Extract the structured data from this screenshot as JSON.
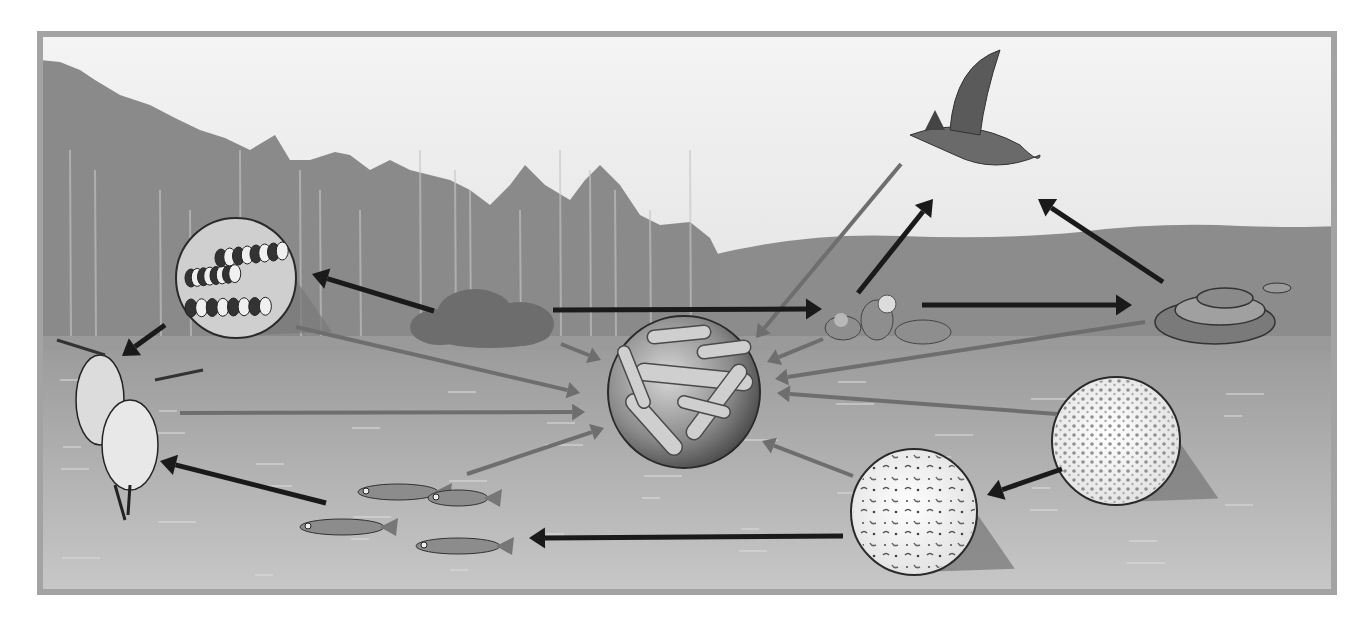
{
  "diagram": {
    "type": "food-web",
    "frame": {
      "x": 40,
      "y": 34,
      "w": 1294,
      "h": 558,
      "border_color": "#a3a3a3",
      "border_width": 6
    },
    "colors": {
      "sky_top": "#f4f4f4",
      "sky_bottom": "#e2e2e2",
      "forest": "#8a8a8a",
      "forest_dark": "#6f6f6f",
      "hill": "#8c8c8c",
      "shore": "#9a9a9a",
      "water_top": "#9c9c9c",
      "water_bottom": "#c9c9c9",
      "feeding_arrow": "#1a1a1a",
      "decomposer_arrow": "#6e6e6e",
      "circle_edge": "#2a2a2a",
      "callout_shadow": "#7a7a7a"
    },
    "nodes": [
      {
        "id": "hawk",
        "label": "hawk",
        "role": "tertiary-consumer",
        "x": 975,
        "y": 125
      },
      {
        "id": "snake",
        "label": "snake",
        "role": "secondary-consumer",
        "x": 1215,
        "y": 310
      },
      {
        "id": "mice",
        "label": "mice",
        "role": "primary-consumer",
        "x": 885,
        "y": 322
      },
      {
        "id": "shrub",
        "label": "shrub",
        "role": "producer",
        "x": 490,
        "y": 322
      },
      {
        "id": "caterpillars",
        "label": "caterpillars",
        "role": "primary-consumer",
        "x": 236,
        "y": 278,
        "r": 60,
        "callout": true
      },
      {
        "id": "herons",
        "label": "herons",
        "role": "secondary-consumer",
        "x": 125,
        "y": 420
      },
      {
        "id": "fish",
        "label": "fish",
        "role": "secondary-consumer",
        "x": 410,
        "y": 510
      },
      {
        "id": "bacteria",
        "label": "decomposer bacteria",
        "role": "decomposer",
        "x": 684,
        "y": 392,
        "r": 76
      },
      {
        "id": "zooplankton",
        "label": "zooplankton",
        "role": "primary-consumer",
        "x": 914,
        "y": 512,
        "r": 63,
        "callout": true
      },
      {
        "id": "phytoplankton",
        "label": "phytoplankton",
        "role": "producer",
        "x": 1116,
        "y": 441,
        "r": 64,
        "callout": true
      }
    ],
    "feeding_arrows": [
      {
        "from": "shrub",
        "to": "caterpillars",
        "x1": 434,
        "y1": 311,
        "x2": 312,
        "y2": 274
      },
      {
        "from": "caterpillars",
        "to": "herons",
        "x1": 165,
        "y1": 325,
        "x2": 122,
        "y2": 356
      },
      {
        "from": "shrub",
        "to": "mice",
        "x1": 553,
        "y1": 310,
        "x2": 822,
        "y2": 309
      },
      {
        "from": "mice",
        "to": "hawk",
        "x1": 858,
        "y1": 293,
        "x2": 933,
        "y2": 199
      },
      {
        "from": "mice",
        "to": "snake",
        "x1": 922,
        "y1": 305,
        "x2": 1132,
        "y2": 305
      },
      {
        "from": "snake",
        "to": "hawk",
        "x1": 1163,
        "y1": 282,
        "x2": 1038,
        "y2": 199
      },
      {
        "from": "fish",
        "to": "herons",
        "x1": 326,
        "y1": 503,
        "x2": 160,
        "y2": 461
      },
      {
        "from": "zooplankton",
        "to": "fish",
        "x1": 843,
        "y1": 536,
        "x2": 529,
        "y2": 538
      },
      {
        "from": "phytoplankton",
        "to": "zooplankton",
        "x1": 1062,
        "y1": 469,
        "x2": 987,
        "y2": 495
      }
    ],
    "decomposer_arrows": [
      {
        "from": "hawk",
        "x1": 901,
        "y1": 164,
        "x2": 756,
        "y2": 338
      },
      {
        "from": "caterpillars",
        "x1": 296,
        "y1": 327,
        "x2": 580,
        "y2": 393
      },
      {
        "from": "shrub",
        "x1": 561,
        "y1": 344,
        "x2": 601,
        "y2": 360
      },
      {
        "from": "herons",
        "x1": 180,
        "y1": 413,
        "x2": 585,
        "y2": 412
      },
      {
        "from": "fish",
        "x1": 467,
        "y1": 474,
        "x2": 604,
        "y2": 428
      },
      {
        "from": "mice",
        "x1": 823,
        "y1": 339,
        "x2": 767,
        "y2": 362
      },
      {
        "from": "snake",
        "x1": 1145,
        "y1": 322,
        "x2": 775,
        "y2": 379
      },
      {
        "from": "phytoplankton",
        "x1": 1057,
        "y1": 414,
        "x2": 777,
        "y2": 393
      },
      {
        "from": "zooplankton",
        "x1": 853,
        "y1": 476,
        "x2": 762,
        "y2": 441
      }
    ]
  }
}
